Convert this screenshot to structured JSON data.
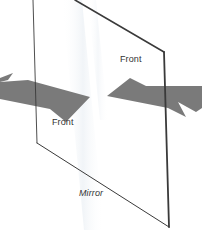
{
  "diagram": {
    "labels": {
      "front_right": "Front",
      "front_left": "Front",
      "mirror": "Mirror"
    },
    "colors": {
      "background": "#ffffff",
      "mirror_edge": "#3a3a3a",
      "arrow_fill": "#7a7a7a",
      "label_text": "#333333",
      "sheen": "#eef2f6"
    },
    "elements": [
      {
        "type": "mirror",
        "shape": "parallelogram",
        "description": "Tilted rectangular mirror plane seen in perspective"
      },
      {
        "type": "arrow",
        "direction": "right",
        "position": "left side",
        "label": "Front",
        "description": "Gray arrow approaching mirror from left, tip near center"
      },
      {
        "type": "arrow",
        "direction": "left",
        "position": "right side",
        "label": "Front",
        "description": "Gray reflected arrow pointing left toward mirror center"
      }
    ]
  }
}
